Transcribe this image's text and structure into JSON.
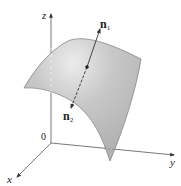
{
  "diagram": {
    "type": "3d-surface-with-normals",
    "axes": {
      "x_label": "x",
      "y_label": "y",
      "z_label": "z",
      "origin_label": "0"
    },
    "normals": [
      {
        "name": "n",
        "subscript": "1",
        "direction": "up"
      },
      {
        "name": "n",
        "subscript": "2",
        "direction": "down"
      }
    ],
    "colors": {
      "surface_fill": "#bdbdbd",
      "surface_highlight": "#e6e6e6",
      "surface_edge": "#7a7a7a",
      "axis": "#555555",
      "normal_line": "#333333"
    }
  }
}
